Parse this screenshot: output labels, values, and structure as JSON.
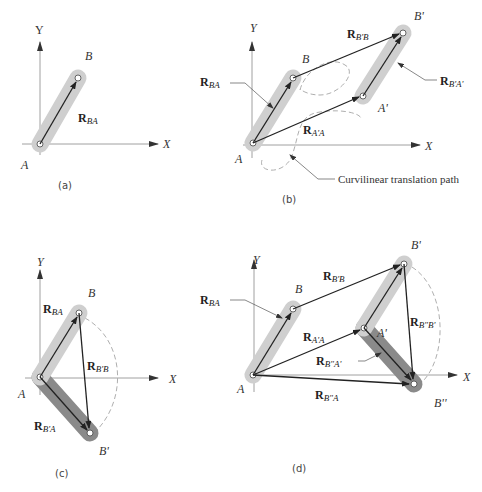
{
  "figure": {
    "panels": [
      {
        "id": "a",
        "caption": "(a)",
        "axes": {
          "x_label": "X",
          "y_label": "Y"
        },
        "points": {
          "A": "A",
          "B": "B"
        },
        "vectors": [
          {
            "main": "R",
            "sub": "BA"
          }
        ]
      },
      {
        "id": "b",
        "caption": "(b)",
        "axes": {
          "x_label": "X",
          "y_label": "Y"
        },
        "points": {
          "A": "A",
          "B": "B",
          "A_prime": "A'",
          "B_prime": "B'"
        },
        "vectors": [
          {
            "main": "R",
            "sub": "BA"
          },
          {
            "main": "R",
            "sub": "B'B"
          },
          {
            "main": "R",
            "sub": "B'A'"
          },
          {
            "main": "R",
            "sub": "A'A"
          }
        ],
        "note": "Curvilinear translation path"
      },
      {
        "id": "c",
        "caption": "(c)",
        "axes": {
          "x_label": "X",
          "y_label": "Y"
        },
        "points": {
          "A": "A",
          "B": "B",
          "B_prime": "B'"
        },
        "vectors": [
          {
            "main": "R",
            "sub": "BA"
          },
          {
            "main": "R",
            "sub": "B'B"
          },
          {
            "main": "R",
            "sub": "B'A"
          }
        ]
      },
      {
        "id": "d",
        "caption": "(d)",
        "axes": {
          "x_label": "X",
          "y_label": "Y"
        },
        "points": {
          "A": "A",
          "B": "B",
          "A_prime": "A'",
          "B_prime": "B'",
          "B_double_prime": "B''"
        },
        "vectors": [
          {
            "main": "R",
            "sub": "BA"
          },
          {
            "main": "R",
            "sub": "B'B"
          },
          {
            "main": "R",
            "sub": "A'A"
          },
          {
            "main": "R",
            "sub": "B''B'"
          },
          {
            "main": "R",
            "sub": "B''A'"
          },
          {
            "main": "R",
            "sub": "B''A"
          }
        ]
      }
    ],
    "colors": {
      "link_light": "#cfcfcf",
      "link_dark": "#8a8a8a",
      "vector": "#222222",
      "axis": "#888888"
    }
  }
}
